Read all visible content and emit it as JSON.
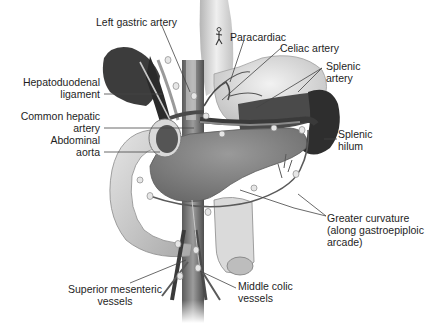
{
  "figure": {
    "style": "grayscale anatomical illustration"
  },
  "labels": {
    "left_gastric_artery": "Left gastric artery",
    "paracardiac": "Paracardiac",
    "celiac_artery": "Celiac artery",
    "splenic_artery_1": "Splenic",
    "splenic_artery_2": "artery",
    "hepatoduodenal_1": "Hepatoduodenal",
    "hepatoduodenal_2": "ligament",
    "common_hepatic_1": "Common hepatic",
    "common_hepatic_2": "artery",
    "abdominal_aorta_1": "Abdominal",
    "abdominal_aorta_2": "aorta",
    "splenic_hilum_1": "Splenic",
    "splenic_hilum_2": "hilum",
    "greater_curvature_1": "Greater curvature",
    "greater_curvature_2": "(along gastroepiploic",
    "greater_curvature_3": "arcade)",
    "superior_mesenteric_1": "Superior mesenteric",
    "superior_mesenteric_2": "vessels",
    "middle_colic_1": "Middle colic",
    "middle_colic_2": "vessels"
  },
  "icons": {
    "paracardiac_marker": "running-figure-icon"
  },
  "colors": {
    "background": "#ffffff",
    "text": "#1e1e1e",
    "leader_line": "#444444",
    "organ_dark": "#3a3a3a",
    "organ_mid": "#8a8a8a",
    "organ_light": "#d8d8d8"
  }
}
